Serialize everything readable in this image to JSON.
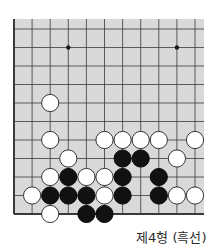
{
  "caption": "제4형 (흑선)",
  "board": {
    "columns": 11,
    "rows": 11,
    "edges": [
      "left",
      "bottom"
    ],
    "background_color": "#d9d9d9",
    "line_color": "#3a3a3a",
    "star_points": [
      [
        1,
        3
      ],
      [
        1,
        9
      ]
    ],
    "stones": [
      {
        "row": 4,
        "col": 2,
        "color": "white"
      },
      {
        "row": 6,
        "col": 2,
        "color": "white"
      },
      {
        "row": 6,
        "col": 5,
        "color": "white"
      },
      {
        "row": 6,
        "col": 6,
        "color": "white"
      },
      {
        "row": 6,
        "col": 7,
        "color": "white"
      },
      {
        "row": 6,
        "col": 8,
        "color": "white"
      },
      {
        "row": 6,
        "col": 10,
        "color": "white"
      },
      {
        "row": 7,
        "col": 3,
        "color": "white"
      },
      {
        "row": 7,
        "col": 6,
        "color": "black"
      },
      {
        "row": 7,
        "col": 7,
        "color": "black"
      },
      {
        "row": 7,
        "col": 9,
        "color": "white"
      },
      {
        "row": 8,
        "col": 2,
        "color": "white"
      },
      {
        "row": 8,
        "col": 3,
        "color": "black"
      },
      {
        "row": 8,
        "col": 4,
        "color": "white"
      },
      {
        "row": 8,
        "col": 5,
        "color": "white"
      },
      {
        "row": 8,
        "col": 6,
        "color": "black"
      },
      {
        "row": 8,
        "col": 8,
        "color": "black"
      },
      {
        "row": 9,
        "col": 1,
        "color": "white"
      },
      {
        "row": 9,
        "col": 2,
        "color": "black"
      },
      {
        "row": 9,
        "col": 3,
        "color": "black"
      },
      {
        "row": 9,
        "col": 4,
        "color": "black"
      },
      {
        "row": 9,
        "col": 5,
        "color": "white"
      },
      {
        "row": 9,
        "col": 6,
        "color": "black"
      },
      {
        "row": 9,
        "col": 8,
        "color": "black"
      },
      {
        "row": 9,
        "col": 9,
        "color": "white"
      },
      {
        "row": 9,
        "col": 10,
        "color": "white"
      },
      {
        "row": 10,
        "col": 2,
        "color": "white"
      },
      {
        "row": 10,
        "col": 4,
        "color": "black"
      },
      {
        "row": 10,
        "col": 5,
        "color": "black"
      }
    ]
  }
}
